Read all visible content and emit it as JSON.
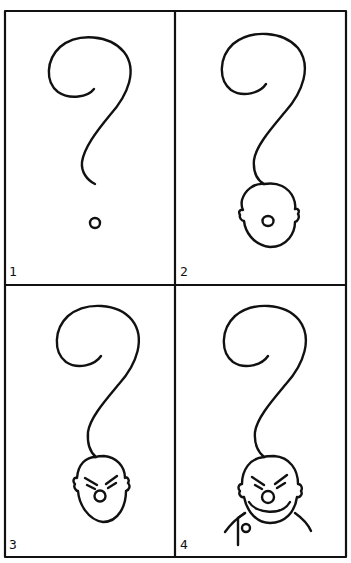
{
  "comic": {
    "panel_count": 4,
    "line_color": "#111111",
    "background": "#ffffff",
    "panels": [
      {
        "number": "1",
        "content": "question-mark-with-dot"
      },
      {
        "number": "2",
        "content": "question-mark-with-head-and-nose"
      },
      {
        "number": "3",
        "content": "question-mark-with-angry-face"
      },
      {
        "number": "4",
        "content": "question-mark-with-grinning-man"
      }
    ]
  }
}
